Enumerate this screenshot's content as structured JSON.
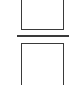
{
  "diagram": {
    "elements": [
      {
        "id": "top-box",
        "shape": "rectangle",
        "label": "",
        "clipped": "top"
      },
      {
        "id": "divider",
        "shape": "horizontal-line"
      },
      {
        "id": "bottom-box",
        "shape": "rectangle",
        "label": "",
        "clipped": "bottom"
      }
    ],
    "colors": {
      "stroke": "#3a3a3a",
      "background": "#ffffff"
    }
  }
}
